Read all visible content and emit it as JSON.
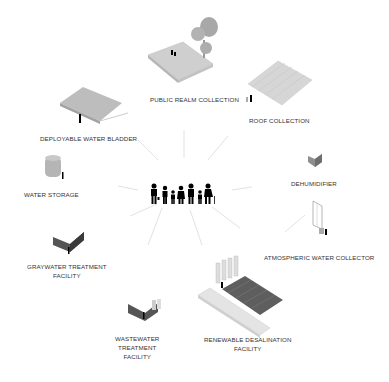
{
  "diagram": {
    "center": {
      "name": "community",
      "icon": "family-icon"
    },
    "nodes": [
      {
        "id": "public-realm",
        "label": "PUBLIC REALM COLLECTION"
      },
      {
        "id": "roof",
        "label": "ROOF COLLECTION"
      },
      {
        "id": "bladder",
        "label": "DEPLOYABLE WATER BLADDER"
      },
      {
        "id": "storage",
        "label": "WATER STORAGE"
      },
      {
        "id": "dehumidifier",
        "label": "DEHUMIDIFIER"
      },
      {
        "id": "atmospheric",
        "label": "ATMOSPHERIC WATER COLLECTOR"
      },
      {
        "id": "graywater",
        "label_line1": "GRAYWATER TREATMENT",
        "label_line2": "FACILITY"
      },
      {
        "id": "wastewater",
        "label_line1": "WASTEWATER",
        "label_line2": "TREATMENT",
        "label_line3": "FACILITY"
      },
      {
        "id": "desalination",
        "label_line1": "RENEWABLE DESALINATION",
        "label_line2": "FACILITY"
      }
    ]
  },
  "colors": {
    "line": "#e0e0e0",
    "text": "#333333",
    "figure": "#000000"
  }
}
